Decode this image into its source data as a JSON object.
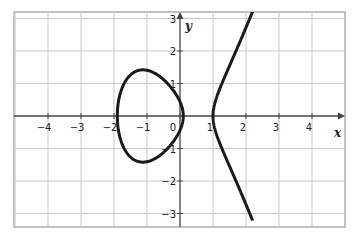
{
  "chart_data": {
    "type": "line",
    "title": "",
    "xlabel": "x",
    "ylabel": "y",
    "xlim": [
      -5.0,
      5.0
    ],
    "ylim": [
      -3.3,
      3.2
    ],
    "grid": true,
    "x_ticks": [
      "−4",
      "−3",
      "−2",
      "−1",
      "0",
      "1",
      "2",
      "3",
      "4"
    ],
    "y_ticks": [
      "3",
      "2",
      "1",
      "−1",
      "−2",
      "−3"
    ],
    "curve": {
      "description": "Elliptic-type curve y² = (x + 1.9)(x − 0.1)(x − 1): a closed oval between x≈−1.9 and x≈0.1, and an unbounded branch starting at x≈1",
      "oval": {
        "x_min": -1.9,
        "x_max": 0.1,
        "y_max": 1.42,
        "y_min": -1.42,
        "x_at_extreme": -1.1
      },
      "branch": {
        "x_vertex": 1.0,
        "points": [
          [
            1.0,
            0
          ],
          [
            1.2,
            0.68
          ],
          [
            1.5,
            1.25
          ],
          [
            1.8,
            1.97
          ],
          [
            2.1,
            2.97
          ],
          [
            2.15,
            3.1
          ]
        ]
      }
    },
    "colors": {
      "curve": "#1a1a1a",
      "grid": "#c8c8c8",
      "axis": "#444444",
      "border": "#999999"
    }
  }
}
